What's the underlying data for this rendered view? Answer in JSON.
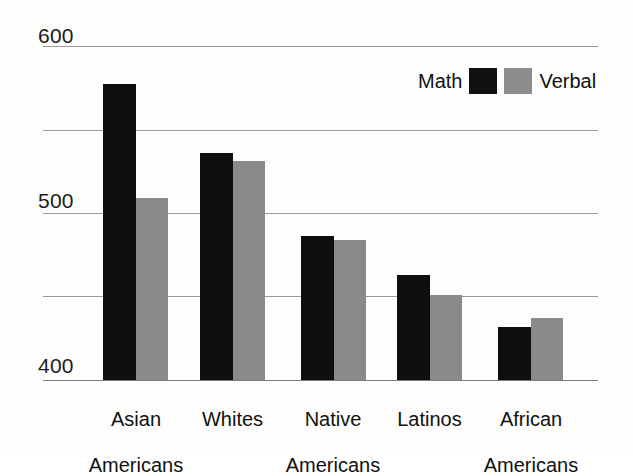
{
  "chart_data": {
    "type": "bar",
    "title": "",
    "subtitle": "",
    "xlabel": "",
    "ylabel": "",
    "categories": [
      "Asian\nAmericans",
      "Whites",
      "Native\nAmericans",
      "Latinos",
      "African\nAmericans"
    ],
    "series": [
      {
        "name": "Math",
        "color": "#111111",
        "values": [
          577,
          536,
          486,
          463,
          432
        ]
      },
      {
        "name": "Verbal",
        "color": "#8a8a8a",
        "values": [
          509,
          531,
          484,
          451,
          437
        ]
      }
    ],
    "ylim": [
      400,
      600
    ],
    "ytick_labels": [
      "600",
      "500",
      "400"
    ],
    "yticks_major": [
      600,
      500,
      400
    ],
    "yticks_gridlines": [
      600,
      550,
      500,
      450,
      400
    ],
    "grid": true,
    "grid_color": "#9a9a9a",
    "legend_position": "top-right",
    "legend_entries": [
      {
        "label": "Math",
        "swatch": "#111111"
      },
      {
        "label": "Verbal",
        "swatch": "#8d8d8d"
      }
    ],
    "background": "#fdfdfc"
  },
  "axis": {
    "y_labels": [
      {
        "text": "600",
        "value": 600
      },
      {
        "text": "500",
        "value": 500
      },
      {
        "text": "400",
        "value": 400
      }
    ]
  },
  "legend": {
    "math_label": "Math",
    "verbal_label": "Verbal"
  },
  "categories": [
    {
      "line1": "Asian",
      "line2": "Americans"
    },
    {
      "line1": "Whites",
      "line2": ""
    },
    {
      "line1": "Native",
      "line2": "Americans"
    },
    {
      "line1": "Latinos",
      "line2": ""
    },
    {
      "line1": "African",
      "line2": "Americans"
    }
  ]
}
